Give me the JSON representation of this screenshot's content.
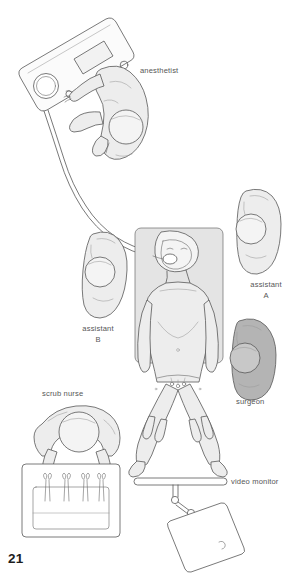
{
  "figure": {
    "page_number": "21",
    "caption_labels": {
      "anesthetist": "anesthetist",
      "assistant_a_line1": "assistant",
      "assistant_a_line2": "A",
      "assistant_b_line1": "assistant",
      "assistant_b_line2": "B",
      "surgeon": "surgeon",
      "scrub_nurse": "scrub nurse",
      "video_monitor": "video monitor"
    },
    "colors": {
      "ink": "#585858",
      "body_fill": "#ededed",
      "surgeon_fill": "#b4b4b4",
      "table_fill": "#e4e4e4",
      "label_text": "#565656",
      "page_number_text": "#1d1d1d",
      "background": "#ffffff"
    },
    "scene": {
      "type": "operating-room-layout-overhead",
      "staff_positions": [
        {
          "role": "anesthetist",
          "location": "head-of-table-upper-left",
          "shaded": false
        },
        {
          "role": "assistant A",
          "location": "patient-right-side",
          "shaded": false
        },
        {
          "role": "assistant B",
          "location": "patient-left-side",
          "shaded": false
        },
        {
          "role": "surgeon",
          "location": "between-patient-legs-lower-right",
          "shaded": true
        },
        {
          "role": "scrub nurse",
          "location": "lower-left-at-instrument-table",
          "shaded": false
        }
      ],
      "equipment": [
        {
          "name": "anesthesia machine",
          "location": "upper-left"
        },
        {
          "name": "operating table",
          "location": "center"
        },
        {
          "name": "instrument table",
          "location": "lower-left",
          "instrument_count": 4
        },
        {
          "name": "video monitor",
          "location": "lower-right",
          "mount": "ceiling-rail-articulated-arm"
        },
        {
          "name": "endotracheal tube",
          "location": "machine-to-patient-mouth"
        }
      ]
    }
  }
}
